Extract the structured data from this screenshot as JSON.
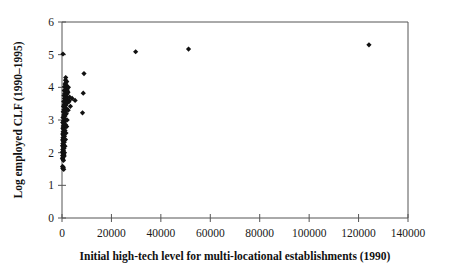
{
  "chart_data": {
    "type": "scatter",
    "title": "",
    "xlabel": "Initial high-tech level for multi-locational establishments (1990)",
    "ylabel": "Log employed CLF (1990–1995)",
    "xlim": [
      0,
      140000
    ],
    "ylim": [
      0,
      6
    ],
    "xticks": [
      0,
      20000,
      40000,
      60000,
      80000,
      100000,
      120000,
      140000
    ],
    "xtick_labels": [
      "0",
      "20000",
      "40000",
      "60000",
      "80000",
      "100000",
      "120000",
      "140000"
    ],
    "yticks": [
      0,
      1,
      2,
      3,
      4,
      5,
      6
    ],
    "ytick_labels": [
      "0",
      "1",
      "2",
      "3",
      "4",
      "5",
      "6"
    ],
    "grid": false,
    "legend": null,
    "marker": "diamond",
    "marker_color": "#111111",
    "axis_color": "#555555",
    "series": [
      {
        "name": "establishments",
        "points": [
          [
            400,
            5.02
          ],
          [
            29800,
            5.09
          ],
          [
            51200,
            5.17
          ],
          [
            124200,
            5.3
          ],
          [
            8900,
            4.42
          ],
          [
            8600,
            3.82
          ],
          [
            8300,
            3.22
          ],
          [
            5300,
            3.6
          ],
          [
            4100,
            3.66
          ],
          [
            1500,
            4.3
          ],
          [
            1400,
            4.22
          ],
          [
            1600,
            4.14
          ],
          [
            1200,
            4.1
          ],
          [
            1800,
            4.06
          ],
          [
            1000,
            4.02
          ],
          [
            1500,
            3.98
          ],
          [
            2100,
            3.95
          ],
          [
            1300,
            3.92
          ],
          [
            900,
            3.9
          ],
          [
            1700,
            3.87
          ],
          [
            2400,
            3.84
          ],
          [
            1100,
            3.81
          ],
          [
            1900,
            3.78
          ],
          [
            800,
            3.75
          ],
          [
            1400,
            3.72
          ],
          [
            2200,
            3.69
          ],
          [
            1000,
            3.66
          ],
          [
            1600,
            3.63
          ],
          [
            2900,
            3.6
          ],
          [
            700,
            3.57
          ],
          [
            1300,
            3.54
          ],
          [
            2000,
            3.51
          ],
          [
            900,
            3.48
          ],
          [
            1500,
            3.45
          ],
          [
            600,
            3.42
          ],
          [
            1100,
            3.38
          ],
          [
            1800,
            3.35
          ],
          [
            800,
            3.32
          ],
          [
            1300,
            3.28
          ],
          [
            500,
            3.25
          ],
          [
            1000,
            3.22
          ],
          [
            1600,
            3.18
          ],
          [
            700,
            3.15
          ],
          [
            1200,
            3.12
          ],
          [
            400,
            3.08
          ],
          [
            900,
            3.05
          ],
          [
            1400,
            3.02
          ],
          [
            600,
            2.98
          ],
          [
            1100,
            2.95
          ],
          [
            300,
            2.92
          ],
          [
            800,
            2.88
          ],
          [
            1500,
            2.85
          ],
          [
            500,
            2.82
          ],
          [
            1000,
            2.78
          ],
          [
            350,
            2.75
          ],
          [
            700,
            2.71
          ],
          [
            1200,
            2.68
          ],
          [
            450,
            2.64
          ],
          [
            850,
            2.6
          ],
          [
            300,
            2.57
          ],
          [
            600,
            2.53
          ],
          [
            1000,
            2.5
          ],
          [
            400,
            2.46
          ],
          [
            750,
            2.42
          ],
          [
            250,
            2.39
          ],
          [
            550,
            2.35
          ],
          [
            900,
            2.32
          ],
          [
            350,
            2.28
          ],
          [
            650,
            2.24
          ],
          [
            200,
            2.21
          ],
          [
            500,
            2.17
          ],
          [
            800,
            2.13
          ],
          [
            300,
            2.1
          ],
          [
            600,
            2.06
          ],
          [
            180,
            2.02
          ],
          [
            420,
            1.98
          ],
          [
            700,
            1.95
          ],
          [
            250,
            1.91
          ],
          [
            500,
            1.87
          ],
          [
            150,
            1.83
          ],
          [
            380,
            1.8
          ],
          [
            600,
            1.76
          ],
          [
            220,
            1.58
          ],
          [
            550,
            1.55
          ],
          [
            300,
            1.52
          ],
          [
            700,
            1.49
          ],
          [
            1900,
            4.18
          ],
          [
            2600,
            4.0
          ],
          [
            2300,
            3.88
          ],
          [
            3100,
            3.7
          ],
          [
            2800,
            3.56
          ],
          [
            3400,
            3.42
          ],
          [
            2500,
            3.3
          ],
          [
            1700,
            3.2
          ],
          [
            2100,
            3.0
          ],
          [
            1900,
            2.8
          ],
          [
            1600,
            2.6
          ],
          [
            1400,
            2.4
          ],
          [
            1200,
            2.2
          ],
          [
            1000,
            2.0
          ],
          [
            900,
            1.9
          ]
        ]
      }
    ]
  }
}
